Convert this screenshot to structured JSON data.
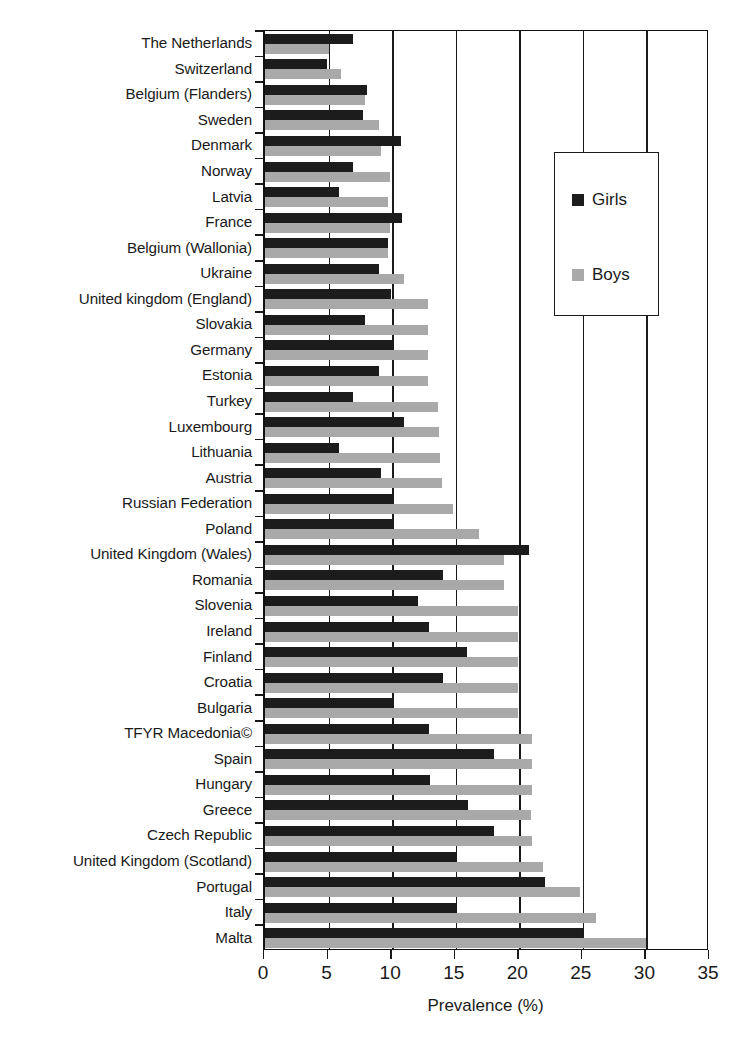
{
  "chart_data": {
    "type": "bar",
    "orientation": "horizontal",
    "title": "",
    "xlabel": "Prevalence (%)",
    "ylabel": "",
    "xlim": [
      0,
      35
    ],
    "xticks": [
      0,
      5,
      10,
      15,
      20,
      25,
      30,
      35
    ],
    "grid": "vertical",
    "legend_position": "upper right inside",
    "categories": [
      "The Netherlands",
      "Switzerland",
      "Belgium (Flanders)",
      "Sweden",
      "Denmark",
      "Norway",
      "Latvia",
      "France",
      "Belgium (Wallonia)",
      "Ukraine",
      "United kingdom (England)",
      "Slovakia",
      "Germany",
      "Estonia",
      "Turkey",
      "Luxembourg",
      "Lithuania",
      "Austria",
      "Russian Federation",
      "Poland",
      "United Kingdom (Wales)",
      "Romania",
      "Slovenia",
      "Ireland",
      "Finland",
      "Croatia",
      "Bulgaria",
      "TFYR Macedonia©",
      "Spain",
      "Hungary",
      "Greece",
      "Czech Republic",
      "United Kingdom (Scotland)",
      "Portugal",
      "Italy",
      "Malta"
    ],
    "series": [
      {
        "name": "Girls",
        "color": "#1c1c1c",
        "values": [
          6.9,
          4.9,
          8.0,
          7.7,
          10.7,
          6.9,
          5.8,
          10.8,
          9.7,
          9.0,
          9.9,
          7.9,
          10.0,
          9.0,
          6.9,
          10.9,
          5.8,
          9.1,
          10.0,
          10.0,
          20.8,
          14.0,
          12.0,
          12.9,
          15.9,
          14.0,
          10.0,
          12.9,
          18.0,
          13.0,
          16.0,
          18.0,
          15.0,
          22.0,
          15.0,
          25.0
        ]
      },
      {
        "name": "Boys",
        "color": "#a9a9a9",
        "values": [
          5.0,
          6.0,
          7.9,
          9.0,
          9.1,
          9.8,
          9.7,
          9.8,
          9.7,
          10.9,
          12.8,
          12.8,
          12.8,
          12.8,
          13.6,
          13.7,
          13.8,
          13.9,
          14.8,
          16.8,
          18.8,
          18.8,
          19.9,
          19.9,
          19.9,
          19.9,
          19.9,
          21.0,
          21.0,
          21.0,
          20.9,
          21.0,
          21.9,
          24.8,
          26.0,
          30.0
        ]
      }
    ]
  },
  "legend": {
    "items": [
      {
        "label": "Girls"
      },
      {
        "label": "Boys"
      }
    ]
  }
}
